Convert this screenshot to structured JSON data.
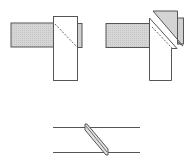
{
  "diagram": {
    "colors": {
      "stroke": "#555555",
      "fill_gray": "#d4d4d4",
      "fill_white": "#ffffff",
      "dashed": "#777777"
    },
    "figures": [
      {
        "id": "butt-joint",
        "position": "top-left",
        "parts": [
          "horizontal-bar",
          "vertical-post",
          "side-tab",
          "hidden-diagonal-cut"
        ]
      },
      {
        "id": "miter-joint",
        "position": "top-right",
        "parts": [
          "horizontal-bar",
          "mitered-post",
          "wedge-piece",
          "side-tab",
          "hidden-diagonal-cut"
        ]
      },
      {
        "id": "splice-joint",
        "position": "bottom-center",
        "parts": [
          "top-line",
          "bottom-line",
          "slanted-splice-strip"
        ]
      }
    ]
  }
}
